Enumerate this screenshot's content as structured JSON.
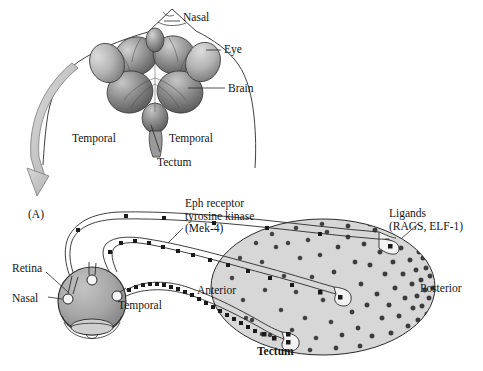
{
  "figure": {
    "panel_label": "(A)",
    "title_implicit": "Retinotectal mapping: Eph receptor / ligand gradient"
  },
  "top_illustration": {
    "name": "dorsal view of embryonic head with eyes and brain",
    "labels": [
      {
        "id": "nasal",
        "text": "Nasal",
        "x": 183,
        "y": 17
      },
      {
        "id": "eye",
        "text": "Eye",
        "x": 224,
        "y": 47
      },
      {
        "id": "brain",
        "text": "Brain",
        "x": 228,
        "y": 84
      },
      {
        "id": "temporal-l",
        "text": "Temporal",
        "x": 74,
        "y": 135
      },
      {
        "id": "temporal-r",
        "text": "Temporal",
        "x": 171,
        "y": 135
      },
      {
        "id": "tectum",
        "text": "Tectum",
        "x": 159,
        "y": 159
      }
    ]
  },
  "bottom_diagram": {
    "labels": [
      {
        "id": "eph-receptor",
        "text": "Eph receptor\ntyrosine kinase\n(Mek-4)",
        "x": 185,
        "y": 200
      },
      {
        "id": "ligands",
        "text": "Ligands\n(RAGS, ELF-1)",
        "x": 389,
        "y": 210
      },
      {
        "id": "retina",
        "text": "Retina",
        "x": 14,
        "y": 267
      },
      {
        "id": "nasal",
        "text": "Nasal",
        "x": 22,
        "y": 297
      },
      {
        "id": "temporal",
        "text": "Temporal",
        "x": 118,
        "y": 303
      },
      {
        "id": "anterior",
        "text": "Anterior",
        "x": 199,
        "y": 288
      },
      {
        "id": "posterior",
        "text": "Posterior",
        "x": 421,
        "y": 286
      },
      {
        "id": "tectum",
        "text": "Tectum",
        "x": 259,
        "y": 349,
        "bold": true
      }
    ],
    "axons": [
      {
        "id": "nasal-axon",
        "receptor_density": "low",
        "terminates": "posterior-tectum"
      },
      {
        "id": "central-axon",
        "receptor_density": "medium",
        "terminates": "mid-tectum"
      },
      {
        "id": "temporal-axon",
        "receptor_density": "high",
        "terminates": "anterior-tectum"
      }
    ],
    "gradient": {
      "description": "ligand concentration increases from anterior to posterior tectum",
      "low_end": "Anterior",
      "high_end": "Posterior"
    }
  },
  "colors": {
    "ink": "#141414",
    "tectum_fill": "#d7d7d7",
    "axon_fill": "#f2f2f2",
    "retina_fill": "#a8a8a8",
    "brain_dark": "#6f6f6f",
    "brain_light": "#c9c9c9",
    "arrow_fill": "#c4c4c4",
    "dot": "#3d3d3d",
    "receptor": "#1a1a1a"
  }
}
